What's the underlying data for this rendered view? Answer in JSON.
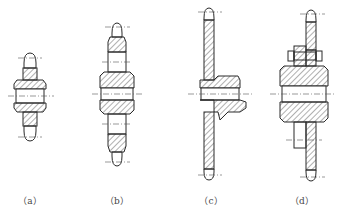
{
  "figure": {
    "panels": [
      {
        "id": "a",
        "label": "（a）",
        "description": "Single-row sprocket with integral hub"
      },
      {
        "id": "b",
        "label": "（b）",
        "description": "Double-row sprocket with integral hub"
      },
      {
        "id": "c",
        "label": "（c）",
        "description": "Welded plate sprocket with offset hub"
      },
      {
        "id": "d",
        "label": "（d）",
        "description": "Bolted plate sprocket on hub"
      }
    ]
  },
  "colors": {
    "line": "#2a2a2a",
    "background": "#ffffff",
    "label": "#444444"
  }
}
